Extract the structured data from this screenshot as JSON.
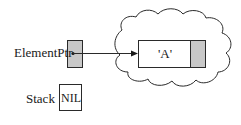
{
  "diagram": {
    "type": "pointer-diagram",
    "labels": {
      "element_ptr": "ElementPtr",
      "stack": "Stack"
    },
    "node": {
      "info": "'A'",
      "next_field": ""
    },
    "stack_value": "NIL",
    "colors": {
      "pointer_fill": "#c8c8c8",
      "line": "#2a2a2a",
      "background": "#ffffff"
    },
    "heap_region": "cloud",
    "arrow": {
      "from": "element_ptr",
      "to": "node"
    }
  }
}
